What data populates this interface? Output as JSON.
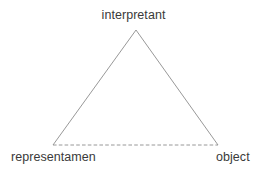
{
  "diagram": {
    "kind": "semiotic-triangle",
    "background_color": "#ffffff",
    "line_color": "#8c8c8c",
    "text_color": "#3a3a3a",
    "nodes": {
      "apex": {
        "label": "interpretant"
      },
      "bottom_left": {
        "label": "representamen"
      },
      "bottom_right": {
        "label": "object"
      }
    },
    "edges": {
      "left_side": {
        "style": "solid"
      },
      "right_side": {
        "style": "solid"
      },
      "base": {
        "style": "dashed"
      }
    },
    "geometry": {
      "apex_x": 136,
      "apex_y": 30,
      "left_x": 53,
      "left_y": 145,
      "right_x": 218,
      "right_y": 145
    }
  }
}
